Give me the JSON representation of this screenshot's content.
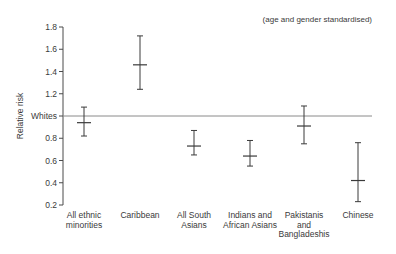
{
  "chart_data": {
    "type": "errorbar",
    "title": "",
    "annotation": "(age and gender standardised)",
    "xlabel": "",
    "ylabel": "Relative risk",
    "ylim": [
      0.2,
      1.8
    ],
    "yticks": [
      {
        "value": 1.8,
        "label": "1.8"
      },
      {
        "value": 1.6,
        "label": "1.6"
      },
      {
        "value": 1.4,
        "label": "1.4"
      },
      {
        "value": 1.2,
        "label": "1.2"
      },
      {
        "value": 1.0,
        "label": "Whites"
      },
      {
        "value": 0.8,
        "label": "0.8"
      },
      {
        "value": 0.6,
        "label": "0.6"
      },
      {
        "value": 0.4,
        "label": "0.4"
      },
      {
        "value": 0.2,
        "label": "0.2"
      }
    ],
    "reference_line": {
      "value": 1.0,
      "label": "Whites"
    },
    "grid": false,
    "legend": null,
    "categories": [
      [
        "All ethnic",
        "minorities"
      ],
      [
        "Caribbean"
      ],
      [
        "All South",
        "Asians"
      ],
      [
        "Indians and",
        "African Asians"
      ],
      [
        "Pakistanis",
        "and",
        "Bangladeshis"
      ],
      [
        "Chinese"
      ]
    ],
    "series": [
      {
        "name": "Relative risk",
        "values": [
          0.94,
          1.46,
          0.73,
          0.64,
          0.91,
          0.42
        ],
        "lower": [
          0.82,
          1.24,
          0.65,
          0.55,
          0.75,
          0.23
        ],
        "upper": [
          1.08,
          1.72,
          0.87,
          0.78,
          1.09,
          0.76
        ]
      }
    ]
  },
  "colors": {
    "axis": "#4a4a4a",
    "bars": "#3a3a3a",
    "reference_line": "#8a8a8a",
    "text": "#3a3a3a"
  }
}
